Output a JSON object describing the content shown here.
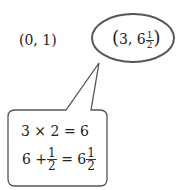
{
  "point_a": {
    "label": "(0, 1)"
  },
  "point_b": {
    "open": "(",
    "whole_x": "3,",
    "whole_y": "6",
    "frac_num": "1",
    "frac_den": "2",
    "close": ")"
  },
  "callout": {
    "line1": "3 × 2 = 6",
    "line2": {
      "a": "6 +",
      "frac1_num": "1",
      "frac1_den": "2",
      "eq": "= 6",
      "frac2_num": "1",
      "frac2_den": "2"
    }
  },
  "colors": {
    "stroke": "#555555",
    "text": "#222222"
  }
}
